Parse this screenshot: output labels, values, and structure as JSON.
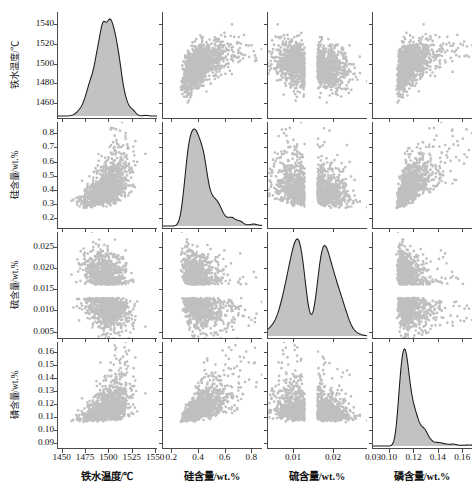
{
  "figure": {
    "kind": "scatter-plot-matrix",
    "n_variables": 4,
    "point_color": "#8a8a8a",
    "kde_fill_color": "#c2c2c2",
    "kde_line_color": "#1a1a1a",
    "axis_color": "#4a4a4a",
    "background": "#ffffff"
  },
  "variables": [
    {
      "key": "iron_temp",
      "axis_label": "铁水温度/℃",
      "name_cn": "铁水温度",
      "unit": "℃",
      "axis_min": 1445,
      "axis_max": 1552,
      "x_ticks": [
        "1450",
        "1475",
        "1500",
        "1525",
        "1550"
      ],
      "x_tick_values": [
        1450,
        1475,
        1500,
        1525,
        1550
      ],
      "y_ticks": [
        "1460",
        "1480",
        "1500",
        "1520",
        "1540"
      ],
      "y_tick_values": [
        1460,
        1480,
        1500,
        1520,
        1540
      ],
      "distribution": "normal",
      "mean": 1498,
      "sd": 11.5,
      "skew": 0.0
    },
    {
      "key": "si_content",
      "axis_label": "硅含量/wt.%",
      "name_cn": "硅含量",
      "unit": "wt.%",
      "axis_min": 0.13,
      "axis_max": 0.88,
      "x_ticks": [
        "0.2",
        "0.4",
        "0.6",
        "0.8"
      ],
      "x_tick_values": [
        0.2,
        0.4,
        0.6,
        0.8
      ],
      "y_ticks": [
        "0.2",
        "0.3",
        "0.4",
        "0.5",
        "0.6",
        "0.7",
        "0.8"
      ],
      "y_tick_values": [
        0.2,
        0.3,
        0.4,
        0.5,
        0.6,
        0.7,
        0.8
      ],
      "distribution": "right-skewed",
      "mean": 0.42,
      "sd": 0.095,
      "skew": 0.85
    },
    {
      "key": "s_content",
      "axis_label": "硫含量/wt.%",
      "name_cn": "硫含量",
      "unit": "wt.%",
      "axis_min": 0.0035,
      "axis_max": 0.0285,
      "x_ticks": [
        "0.01",
        "0.02",
        "0.03"
      ],
      "x_tick_values": [
        0.01,
        0.02,
        0.03
      ],
      "y_ticks": [
        "0.005",
        "0.010",
        "0.015",
        "0.020",
        "0.025"
      ],
      "y_tick_values": [
        0.005,
        0.01,
        0.015,
        0.02,
        0.025
      ],
      "distribution": "bimodal",
      "mean": 0.0145,
      "sd": 0.0042,
      "skew": 0.15
    },
    {
      "key": "p_content",
      "axis_label": "磷含量/wt.%",
      "name_cn": "磷含量",
      "unit": "wt.%",
      "axis_min": 0.086,
      "axis_max": 0.168,
      "x_ticks": [
        "0.10",
        "0.12",
        "0.14",
        "0.16"
      ],
      "x_tick_values": [
        0.1,
        0.12,
        0.14,
        0.16
      ],
      "y_ticks": [
        "0.09",
        "0.10",
        "0.11",
        "0.12",
        "0.13",
        "0.14",
        "0.15",
        "0.16"
      ],
      "y_tick_values": [
        0.09,
        0.1,
        0.11,
        0.12,
        0.13,
        0.14,
        0.15,
        0.16
      ],
      "distribution": "right-skewed-peaked",
      "mean": 0.1175,
      "sd": 0.0098,
      "skew": 1.3
    }
  ],
  "chart_data": {
    "type": "scatter",
    "title": "",
    "subtitle": "",
    "xlabel": "",
    "ylabel": "",
    "grid": false,
    "legend": false,
    "n_points": 1400,
    "matrix_size": 4,
    "diagonal": "kde",
    "categories": [
      "铁水温度/℃",
      "硅含量/wt.%",
      "硫含量/wt.%",
      "磷含量/wt.%"
    ],
    "correlation_matrix": [
      [
        1.0,
        0.52,
        -0.4,
        0.45
      ],
      [
        0.52,
        1.0,
        -0.42,
        0.7
      ],
      [
        -0.4,
        -0.42,
        1.0,
        -0.22
      ],
      [
        0.45,
        0.7,
        -0.22,
        1.0
      ]
    ],
    "panels": [
      {
        "row": 0,
        "col": 0,
        "kind": "kde",
        "var": "iron_temp"
      },
      {
        "row": 0,
        "col": 1,
        "kind": "scatter",
        "x": "si_content",
        "y": "iron_temp",
        "r": 0.52
      },
      {
        "row": 0,
        "col": 2,
        "kind": "scatter",
        "x": "s_content",
        "y": "iron_temp",
        "r": -0.4
      },
      {
        "row": 0,
        "col": 3,
        "kind": "scatter",
        "x": "p_content",
        "y": "iron_temp",
        "r": 0.45
      },
      {
        "row": 1,
        "col": 0,
        "kind": "scatter",
        "x": "iron_temp",
        "y": "si_content",
        "r": 0.52
      },
      {
        "row": 1,
        "col": 1,
        "kind": "kde",
        "var": "si_content"
      },
      {
        "row": 1,
        "col": 2,
        "kind": "scatter",
        "x": "s_content",
        "y": "si_content",
        "r": -0.42
      },
      {
        "row": 1,
        "col": 3,
        "kind": "scatter",
        "x": "p_content",
        "y": "si_content",
        "r": 0.7
      },
      {
        "row": 2,
        "col": 0,
        "kind": "scatter",
        "x": "iron_temp",
        "y": "s_content",
        "r": -0.4
      },
      {
        "row": 2,
        "col": 1,
        "kind": "scatter",
        "x": "si_content",
        "y": "s_content",
        "r": -0.42
      },
      {
        "row": 2,
        "col": 2,
        "kind": "kde",
        "var": "s_content"
      },
      {
        "row": 2,
        "col": 3,
        "kind": "scatter",
        "x": "p_content",
        "y": "s_content",
        "r": -0.22
      },
      {
        "row": 3,
        "col": 0,
        "kind": "scatter",
        "x": "iron_temp",
        "y": "p_content",
        "r": 0.45
      },
      {
        "row": 3,
        "col": 1,
        "kind": "scatter",
        "x": "si_content",
        "y": "p_content",
        "r": 0.7
      },
      {
        "row": 3,
        "col": 2,
        "kind": "scatter",
        "x": "s_content",
        "y": "p_content",
        "r": -0.22
      },
      {
        "row": 3,
        "col": 3,
        "kind": "kde",
        "var": "p_content"
      }
    ]
  }
}
